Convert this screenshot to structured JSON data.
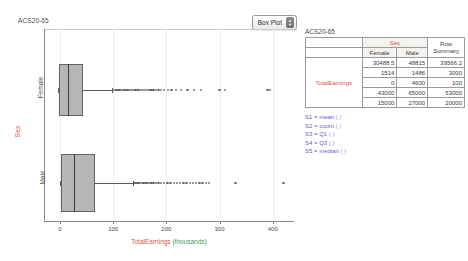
{
  "plot": {
    "title": "ACS20-65",
    "view_type": "Box Plot",
    "y_axis_variable": "Sex",
    "y_categories": [
      "Female",
      "Male"
    ],
    "x_axis_variable": "TotalEarnings",
    "x_axis_units": "(thousands)",
    "x_ticks": [
      "0",
      "100",
      "200",
      "300",
      "400"
    ],
    "colors": {
      "variable_red": "#d9534f",
      "units_green": "#3f9c55",
      "box_fill": "#b6b6b6"
    }
  },
  "summary": {
    "title": "ACS20-65",
    "group_header": "Sex",
    "columns": [
      "Female",
      "Male"
    ],
    "row_summary_header_line1": "Row",
    "row_summary_header_line2": "Summary",
    "row_label": "TotalEarnings",
    "rows": [
      {
        "female": "30488.5",
        "male": "48815",
        "summary": "39566.2"
      },
      {
        "female": "1514",
        "male": "1486",
        "summary": "3000"
      },
      {
        "female": "0",
        "male": "4600",
        "summary": "100"
      },
      {
        "female": "43000",
        "male": "65000",
        "summary": "53000"
      },
      {
        "female": "15000",
        "male": "27000",
        "summary": "20000"
      }
    ],
    "legend": [
      {
        "key": "S1",
        "stat": "mean",
        "paren": "(  )"
      },
      {
        "key": "S2",
        "stat": "count",
        "paren": "(  )"
      },
      {
        "key": "S3",
        "stat": "Q1",
        "paren": "(  )"
      },
      {
        "key": "S4",
        "stat": "Q3",
        "paren": "(  )"
      },
      {
        "key": "S5",
        "stat": "median",
        "paren": "(  )"
      }
    ]
  },
  "chart_data": {
    "type": "boxplot",
    "title": "ACS20-65",
    "xlabel": "TotalEarnings (thousands)",
    "ylabel": "Sex",
    "xlim": [
      -30,
      440
    ],
    "xticks": [
      0,
      100,
      200,
      300,
      400
    ],
    "grid": false,
    "legend": "none",
    "categories": [
      "Female",
      "Male"
    ],
    "series": [
      {
        "name": "Female",
        "min": -4,
        "q1": -1,
        "median": 15,
        "q3": 43,
        "whisker_low": -4,
        "whisker_high": 98,
        "mean": 30.4885,
        "count": 1514,
        "outliers": [
          100,
          103,
          106,
          109,
          112,
          115,
          118,
          121,
          124,
          127,
          130,
          133,
          136,
          139,
          142,
          145,
          148,
          152,
          156,
          160,
          164,
          168,
          172,
          176,
          180,
          185,
          190,
          196,
          203,
          210,
          218,
          228,
          240,
          252,
          265,
          300,
          310,
          390,
          395
        ]
      },
      {
        "name": "Male",
        "min": 4.6,
        "q1": 2,
        "median": 27,
        "q3": 65,
        "whisker_low": 0,
        "whisker_high": 138,
        "mean": 48.815,
        "count": 1486,
        "outliers": [
          140,
          144,
          148,
          151,
          154,
          157,
          160,
          163,
          166,
          169,
          172,
          176,
          180,
          185,
          190,
          196,
          202,
          208,
          214,
          220,
          226,
          232,
          238,
          244,
          250,
          256,
          262,
          268,
          274,
          280,
          330,
          420
        ]
      }
    ]
  }
}
